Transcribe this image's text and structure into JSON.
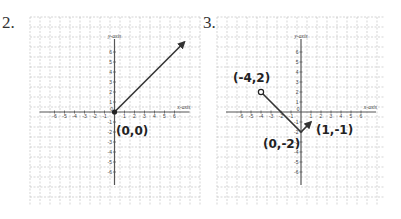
{
  "problems": [
    {
      "number": "2."
    },
    {
      "number": "3."
    }
  ],
  "chart_data": [
    {
      "type": "line",
      "title": "2.",
      "xlabel": "x-axis",
      "ylabel": "y-axis",
      "xlim": [
        -7,
        7
      ],
      "ylim": [
        -7,
        7
      ],
      "grid": true,
      "x_ticks": [
        -6,
        -5,
        -4,
        -3,
        -2,
        -1,
        1,
        2,
        3,
        4,
        5,
        6
      ],
      "y_ticks": [
        6,
        5,
        4,
        3,
        2,
        1,
        -1,
        -2,
        -3,
        -4,
        -5,
        -6
      ],
      "series": [
        {
          "name": "ray",
          "points": [
            [
              0,
              0
            ],
            [
              7,
              7
            ]
          ],
          "start": "closed-dot",
          "end": "arrow"
        }
      ],
      "annotations": [
        {
          "text": "(0,0)",
          "x": 0,
          "y": 0
        }
      ]
    },
    {
      "type": "line",
      "title": "3.",
      "xlabel": "x-axis",
      "ylabel": "y-axis",
      "xlim": [
        -7,
        7
      ],
      "ylim": [
        -7,
        7
      ],
      "grid": true,
      "x_ticks": [
        -6,
        -5,
        -4,
        -3,
        -2,
        -1,
        1,
        2,
        3,
        4,
        5,
        6
      ],
      "y_ticks": [
        6,
        5,
        4,
        3,
        2,
        1,
        -1,
        -2,
        -3,
        -4,
        -5,
        -6
      ],
      "series": [
        {
          "name": "piecewise",
          "points": [
            [
              -4,
              2
            ],
            [
              0,
              -2
            ],
            [
              1,
              -1
            ]
          ],
          "start": "open-dot",
          "end": "arrow"
        }
      ],
      "annotations": [
        {
          "text": "(-4,2)",
          "x": -4,
          "y": 2
        },
        {
          "text": "(0,-2)",
          "x": 0,
          "y": -2
        },
        {
          "text": "(1,-1)",
          "x": 1,
          "y": -1
        }
      ]
    }
  ]
}
